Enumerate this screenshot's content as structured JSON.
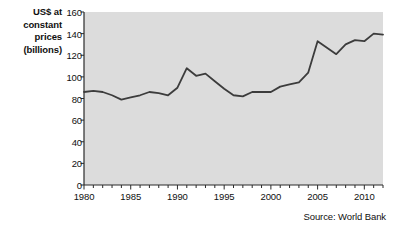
{
  "chart_data": {
    "type": "line",
    "title": "",
    "ylabel": "US$ at constant prices (billions)",
    "ylabel_lines": [
      "US$ at",
      "constant",
      "prices",
      "(billions)"
    ],
    "xlabel": "",
    "source": "Source: World Bank",
    "ylim": [
      0,
      160
    ],
    "yticks": [
      0,
      20,
      40,
      60,
      80,
      100,
      120,
      140,
      160
    ],
    "ytick_labels": [
      "0",
      "20",
      "40",
      "60",
      "80",
      "100",
      "120",
      "140",
      "160"
    ],
    "xlim": [
      1980,
      2012
    ],
    "xticks": [
      1980,
      1985,
      1990,
      1995,
      2000,
      2005,
      2010
    ],
    "xtick_labels": [
      "1980",
      "1985",
      "1990",
      "1995",
      "2000",
      "2005",
      "2010"
    ],
    "xtick_minor_step": 1,
    "grid": false,
    "legend": false,
    "plot_background": "#dcdcdc",
    "line_color": "#3c3c3c",
    "x": [
      1980,
      1981,
      1982,
      1983,
      1984,
      1985,
      1986,
      1987,
      1988,
      1989,
      1990,
      1991,
      1992,
      1993,
      1994,
      1995,
      1996,
      1997,
      1998,
      1999,
      2000,
      2001,
      2002,
      2003,
      2004,
      2005,
      2006,
      2007,
      2008,
      2009,
      2010,
      2011,
      2012
    ],
    "values": [
      86,
      87,
      86,
      83,
      79,
      81,
      83,
      86,
      85,
      83,
      90,
      108,
      101,
      103,
      96,
      89,
      83,
      82,
      86,
      86,
      86,
      91,
      93,
      95,
      104,
      133,
      127,
      121,
      130,
      134,
      133,
      140,
      139
    ],
    "series": [
      {
        "name": "US$ at constant prices (billions)",
        "values": [
          86,
          87,
          86,
          83,
          79,
          81,
          83,
          86,
          85,
          83,
          90,
          108,
          101,
          103,
          96,
          89,
          83,
          82,
          86,
          86,
          86,
          91,
          93,
          95,
          104,
          133,
          127,
          121,
          130,
          134,
          133,
          140,
          139
        ]
      }
    ]
  }
}
